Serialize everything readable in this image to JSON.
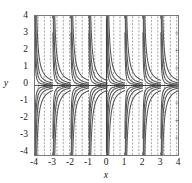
{
  "figure": {
    "kind": "slope-field",
    "background": "#ffffff",
    "frame_color": "#6f6f6f",
    "dash_color": "#9a9a9a",
    "curve_color": "#555555",
    "axis_line_color": "#444444",
    "text_color": "#1a1a1a"
  },
  "chart_data": {
    "type": "line",
    "title": "",
    "subtitle": "",
    "xlabel": "x",
    "ylabel": "y",
    "xlim": [
      -4,
      4
    ],
    "ylim": [
      -4,
      4
    ],
    "grid": false,
    "legend": null,
    "annotations": [],
    "xticks": [
      -4,
      -3,
      -2,
      -1,
      0,
      1,
      2,
      3,
      4
    ],
    "yticks": [
      4,
      3,
      2,
      1,
      0,
      -1,
      -2,
      -3,
      -4
    ],
    "xticklabels": [
      "-4",
      "-3",
      "-2",
      "-1",
      "0",
      "1",
      "2",
      "3",
      "4"
    ],
    "yticklabels": [
      "4",
      "3",
      "2",
      "1",
      "0",
      "-1",
      "-2",
      "-3",
      "-4"
    ],
    "slope_field": {
      "x_samples": [
        -3.8,
        -3.45,
        -3.1,
        -2.75,
        -2.4,
        -2.05,
        -1.7,
        -1.35,
        -1.0,
        -0.65,
        -0.3,
        0.05,
        0.4,
        0.75,
        1.1,
        1.45,
        1.8,
        2.15,
        2.5,
        2.85,
        3.2,
        3.55,
        3.9
      ],
      "y_samples": [
        3.8,
        3.4,
        3.0,
        2.6,
        2.2,
        1.8,
        1.4,
        1.0,
        0.6,
        0.2,
        -0.2,
        -0.6,
        -1.0,
        -1.4,
        -1.8,
        -2.2,
        -2.6,
        -3.0,
        -3.4,
        -3.8
      ],
      "segment_length": 6,
      "note": "dashes are near-vertical, tilting with local slope"
    },
    "solution_curves": {
      "asymptotes_x": [
        -3.0,
        -2.0,
        -1.0,
        0.0,
        1.0,
        2.0,
        3.0
      ],
      "count_upper": 8,
      "count_lower": 8,
      "horizontal_asymptote_y": 0,
      "note": "upper-half curves fall from +infinity to 0; lower-half curves rise from -infinity to 0"
    }
  },
  "axes": {
    "x_axis_label": "x",
    "y_axis_label": "y"
  }
}
